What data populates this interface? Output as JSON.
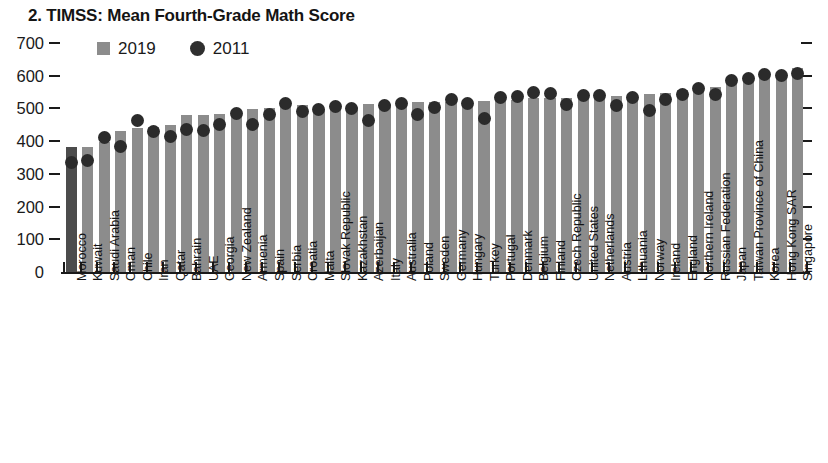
{
  "chart_data": {
    "type": "bar",
    "title": "2. TIMSS: Mean Fourth-Grade Math Score",
    "xlabel": "",
    "ylabel": "",
    "ylim": [
      0,
      700
    ],
    "yticks": [
      0,
      100,
      200,
      300,
      400,
      500,
      600,
      700
    ],
    "ytick_labels": [
      "0",
      "100",
      "200",
      "300",
      "400",
      "500",
      "600",
      "700"
    ],
    "grid": false,
    "legend_position": "top-left",
    "legend": [
      {
        "label": "2019",
        "marker": "square",
        "color": "#8c8c8c"
      },
      {
        "label": "2011",
        "marker": "circle",
        "color": "#2b2b2b"
      }
    ],
    "highlight_category": "Morocco",
    "highlight_color": "#4c4c4c",
    "bar_color": "#8c8c8c",
    "categories": [
      "Morocco",
      "Kuwait",
      "Saudi Arabia",
      "Oman",
      "Chile",
      "Iran",
      "Qatar",
      "Bahrain",
      "UAE",
      "Georgia",
      "New Zealand",
      "Armenia",
      "Spain",
      "Serbia",
      "Croatia",
      "Malta",
      "Slovak Republic",
      "Kazakhstan",
      "Azerbaijan",
      "Italy",
      "Australia",
      "Poland",
      "Sweden",
      "Germany",
      "Hungary",
      "Turkey",
      "Portugal",
      "Denmark",
      "Belgium",
      "Finland",
      "Czech Republic",
      "United States",
      "Netherlands",
      "Austria",
      "Lithuania",
      "Norway",
      "Ireland",
      "England",
      "Northern Ireland",
      "Russian Federation",
      "Japan",
      "Taiwan Province of China",
      "Korea",
      "Hong Kong SAR",
      "Singapore"
    ],
    "series": [
      {
        "name": "2019",
        "marker": "bar",
        "values": [
          383,
          383,
          398,
          431,
          441,
          443,
          449,
          481,
          481,
          483,
          487,
          498,
          502,
          508,
          509,
          499,
          510,
          503,
          515,
          515,
          516,
          520,
          521,
          521,
          523,
          523,
          525,
          525,
          532,
          532,
          533,
          535,
          538,
          539,
          542,
          543,
          548,
          556,
          566,
          567,
          593,
          599,
          600,
          602,
          625
        ]
      },
      {
        "name": "2011",
        "marker": "circle",
        "values": [
          335,
          342,
          410,
          385,
          462,
          431,
          413,
          436,
          434,
          450,
          486,
          452,
          482,
          516,
          490,
          496,
          507,
          501,
          463,
          508,
          516,
          481,
          504,
          528,
          515,
          469,
          532,
          537,
          549,
          545,
          511,
          541,
          540,
          508,
          534,
          495,
          527,
          542,
          562,
          542,
          585,
          591,
          605,
          602,
          606
        ]
      }
    ]
  }
}
